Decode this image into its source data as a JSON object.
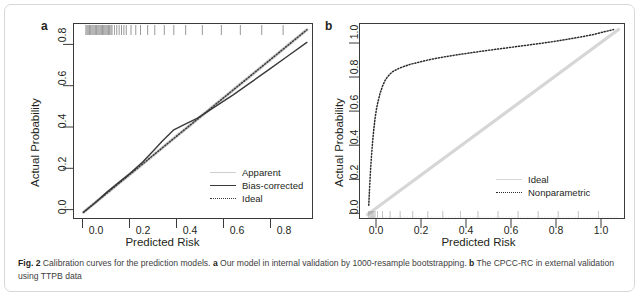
{
  "figure": {
    "caption_label": "Fig. 2",
    "caption_text": " Calibration curves for the prediction models. ",
    "caption_a_marker": "a",
    "caption_a_text": " Our model in internal validation by 1000-resample bootstrapping. ",
    "caption_b_marker": "b",
    "caption_b_text": " The CPCC-RC in external validation using TTPB data",
    "border_color": "#d8d8d8"
  },
  "panel_a": {
    "letter": "a",
    "xlabel": "Predicted Risk",
    "ylabel": "Actual Probability",
    "xticks": [
      "0.0",
      "0.2",
      "0.4",
      "0.6",
      "0.8"
    ],
    "yticks": [
      "0.0",
      "0.2",
      "0.4",
      "0.6",
      "0.8"
    ],
    "legend": [
      {
        "label": "Apparent",
        "style": "solid",
        "color": "#cfcfcf"
      },
      {
        "label": "Bias-corrected",
        "style": "solid",
        "color": "#3a3a3a"
      },
      {
        "label": "Ideal",
        "style": "dotted",
        "color": "#3a3a3a"
      }
    ]
  },
  "panel_b": {
    "letter": "b",
    "xlabel": "Predicted Risk",
    "ylabel": "Actual Probability",
    "xticks": [
      "0.0",
      "0.2",
      "0.4",
      "0.6",
      "0.8",
      "1.0"
    ],
    "yticks": [
      "0.0",
      "0.2",
      "0.4",
      "0.6",
      "0.8",
      "1.0"
    ],
    "legend": [
      {
        "label": "Ideal",
        "style": "solid",
        "color": "#d6d6d6"
      },
      {
        "label": "Nonparametric",
        "style": "dotted",
        "color": "#2b2b2b"
      }
    ]
  },
  "chart_data": [
    {
      "type": "line",
      "panel": "a",
      "title": "Our model in internal validation by 1000-resample bootstrapping",
      "xlabel": "Predicted Risk",
      "ylabel": "Actual Probability",
      "xlim": [
        -0.04,
        0.97
      ],
      "ylim": [
        -0.04,
        0.97
      ],
      "xticks": [
        0.0,
        0.2,
        0.4,
        0.6,
        0.8
      ],
      "yticks": [
        0.0,
        0.2,
        0.4,
        0.6,
        0.8
      ],
      "grid": false,
      "legend_position": "bottom-right",
      "series": [
        {
          "name": "Apparent",
          "style": "solid",
          "color": "#cfcfcf",
          "x": [
            0.0,
            0.05,
            0.1,
            0.15,
            0.2,
            0.25,
            0.3,
            0.35,
            0.4,
            0.45,
            0.5,
            0.55,
            0.6,
            0.65,
            0.7,
            0.75,
            0.8,
            0.85,
            0.9,
            0.94
          ],
          "y": [
            0.0,
            0.05,
            0.1,
            0.15,
            0.2,
            0.25,
            0.3,
            0.35,
            0.4,
            0.45,
            0.5,
            0.55,
            0.6,
            0.65,
            0.7,
            0.75,
            0.8,
            0.85,
            0.9,
            0.94
          ]
        },
        {
          "name": "Bias-corrected",
          "style": "solid",
          "color": "#3a3a3a",
          "x": [
            0.0,
            0.05,
            0.1,
            0.15,
            0.2,
            0.25,
            0.3,
            0.33,
            0.38,
            0.43,
            0.48,
            0.53,
            0.58,
            0.63,
            0.7,
            0.78,
            0.86,
            0.94
          ],
          "y": [
            0.0,
            0.05,
            0.105,
            0.155,
            0.205,
            0.26,
            0.325,
            0.365,
            0.425,
            0.455,
            0.485,
            0.525,
            0.565,
            0.605,
            0.665,
            0.735,
            0.805,
            0.875
          ]
        },
        {
          "name": "Ideal",
          "style": "dotted",
          "color": "#3a3a3a",
          "x": [
            0.0,
            0.94
          ],
          "y": [
            0.0,
            0.94
          ]
        }
      ],
      "rug": {
        "position": "top",
        "note": "density of predicted risks, densest near 0.02-0.12, sparse beyond 0.35",
        "x": [
          0.01,
          0.015,
          0.02,
          0.025,
          0.03,
          0.035,
          0.04,
          0.045,
          0.05,
          0.055,
          0.06,
          0.065,
          0.07,
          0.075,
          0.08,
          0.085,
          0.09,
          0.095,
          0.1,
          0.105,
          0.11,
          0.115,
          0.12,
          0.13,
          0.14,
          0.15,
          0.16,
          0.17,
          0.18,
          0.2,
          0.22,
          0.24,
          0.27,
          0.3,
          0.34,
          0.38,
          0.43,
          0.5,
          0.58,
          0.66,
          0.75,
          0.84
        ]
      }
    },
    {
      "type": "line",
      "panel": "b",
      "title": "The CPCC-RC in external validation using TTPB data",
      "xlabel": "Predicted Risk",
      "ylabel": "Actual Probability",
      "xlim": [
        -0.03,
        1.03
      ],
      "ylim": [
        -0.03,
        1.03
      ],
      "xticks": [
        0.0,
        0.2,
        0.4,
        0.6,
        0.8,
        1.0
      ],
      "yticks": [
        0.0,
        0.2,
        0.4,
        0.6,
        0.8,
        1.0
      ],
      "grid": false,
      "legend_position": "bottom-right",
      "series": [
        {
          "name": "Ideal",
          "style": "solid",
          "color": "#d6d6d6",
          "x": [
            0.0,
            1.0
          ],
          "y": [
            0.0,
            1.0
          ]
        },
        {
          "name": "Nonparametric",
          "style": "dotted",
          "color": "#2b2b2b",
          "x": [
            0.005,
            0.008,
            0.012,
            0.016,
            0.02,
            0.025,
            0.03,
            0.035,
            0.04,
            0.05,
            0.06,
            0.07,
            0.08,
            0.09,
            0.1,
            0.12,
            0.14,
            0.17,
            0.2,
            0.25,
            0.3,
            0.35,
            0.4,
            0.45,
            0.5,
            0.55,
            0.6,
            0.65,
            0.7,
            0.75,
            0.8,
            0.85,
            0.9,
            0.95,
            0.98
          ],
          "y": [
            0.05,
            0.14,
            0.24,
            0.32,
            0.39,
            0.46,
            0.52,
            0.565,
            0.6,
            0.655,
            0.695,
            0.725,
            0.745,
            0.76,
            0.772,
            0.787,
            0.798,
            0.812,
            0.822,
            0.838,
            0.851,
            0.862,
            0.872,
            0.882,
            0.891,
            0.9,
            0.909,
            0.918,
            0.927,
            0.937,
            0.948,
            0.96,
            0.973,
            0.99,
            1.0
          ]
        }
      ],
      "rug": {
        "position": "bottom",
        "note": "dense cluster of predicted risks near 0, sparse thin marks across the rest of the range",
        "x": [
          0.005,
          0.01,
          0.015,
          0.02,
          0.025,
          0.03,
          0.04,
          0.06,
          0.09,
          0.13,
          0.18,
          0.24,
          0.3,
          0.37,
          0.44,
          0.52,
          0.6,
          0.68,
          0.76,
          0.84,
          0.92
        ]
      }
    }
  ]
}
